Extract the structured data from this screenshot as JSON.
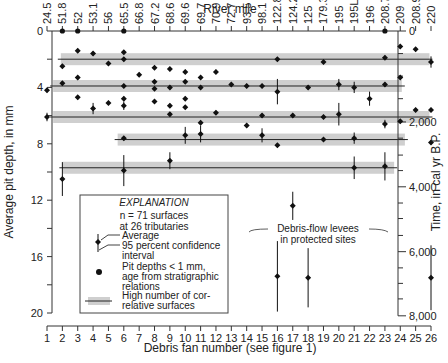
{
  "chart_data": {
    "type": "scatter",
    "title_top_axis": "River mile",
    "xlabel": "Debris fan number (see figure 1)",
    "ylabel": "Average pit depth, in mm",
    "ylabel_right": "Time, in cal yr B.P.",
    "xlim": [
      1,
      26
    ],
    "ylim": [
      0,
      20
    ],
    "x_ticks": [
      "1",
      "2",
      "3",
      "4",
      "5",
      "6",
      "7",
      "8",
      "9",
      "10",
      "11",
      "12",
      "13",
      "14",
      "15",
      "16",
      "17",
      "18",
      "19",
      "20",
      "21",
      "22",
      "23",
      "24",
      "25",
      "26"
    ],
    "y_ticks": [
      "0",
      "4",
      "8",
      "12",
      "16",
      "20"
    ],
    "y_tick_values": [
      0,
      4,
      8,
      12,
      16,
      20
    ],
    "right_ticks": [
      {
        "label": "0",
        "depth": 0
      },
      {
        "label": "2,000",
        "depth": 6.45
      },
      {
        "label": "4,000",
        "depth": 11.05
      },
      {
        "label": "6,000",
        "depth": 15.65
      },
      {
        "label": "8,000",
        "depth": 20.2
      }
    ],
    "right_minor_depths": [
      1.6,
      3.2,
      4.8,
      7.6,
      8.8,
      9.9,
      12.2,
      13.3,
      14.5,
      16.8,
      17.9,
      19.0
    ],
    "river_miles": [
      "24.5",
      "51.8",
      "52",
      "53.1",
      "56",
      "65.5",
      "66.8",
      "67.2",
      "68.6",
      "69.6",
      "69.7",
      "70.9",
      "72.7",
      "93.5",
      "98.1",
      "122.8",
      "124.2",
      "125",
      "179.3",
      "195",
      "195L",
      "196",
      "208.7",
      "209",
      "208.9",
      "220"
    ],
    "grid": false,
    "legend_position": "bottom-left",
    "correlative_bands": [
      {
        "depth": 2.0,
        "from": 1.9,
        "to": 25.9
      },
      {
        "depth": 3.9,
        "from": 1.4,
        "to": 24.1
      },
      {
        "depth": 6.1,
        "from": 1.4,
        "to": 25.9
      },
      {
        "depth": 7.7,
        "from": 5.6,
        "to": 24.3
      },
      {
        "depth": 9.7,
        "from": 2.0,
        "to": 23.6
      }
    ],
    "points": [
      {
        "fan": 2,
        "depth": 0,
        "type": "dot"
      },
      {
        "fan": 3,
        "depth": 0,
        "type": "dot"
      },
      {
        "fan": 6,
        "depth": 0,
        "type": "dot"
      },
      {
        "fan": 23,
        "depth": 0,
        "type": "dot"
      },
      {
        "fan": 3,
        "depth": 1.4,
        "type": "avg"
      },
      {
        "fan": 4,
        "depth": 1.6,
        "type": "avg"
      },
      {
        "fan": 6,
        "depth": 1.5,
        "type": "avg"
      },
      {
        "fan": 2,
        "depth": 2.5,
        "type": "avg"
      },
      {
        "fan": 5,
        "depth": 2.3,
        "type": "avg"
      },
      {
        "fan": 6,
        "depth": 2.0,
        "type": "avg"
      },
      {
        "fan": 8,
        "depth": 2.6,
        "type": "avg"
      },
      {
        "fan": 16,
        "depth": 2.0,
        "type": "avg"
      },
      {
        "fan": 19,
        "depth": 2.2,
        "type": "avg"
      },
      {
        "fan": 23,
        "depth": 1.9,
        "type": "avg"
      },
      {
        "fan": 24,
        "depth": 1.1,
        "type": "avg"
      },
      {
        "fan": 25,
        "depth": 1.3,
        "type": "avg"
      },
      {
        "fan": 26,
        "depth": 2.2,
        "type": "avg",
        "err": 0.4
      },
      {
        "fan": 7,
        "depth": 3.1,
        "type": "avg"
      },
      {
        "fan": 9,
        "depth": 2.7,
        "type": "avg"
      },
      {
        "fan": 10,
        "depth": 2.9,
        "type": "avg"
      },
      {
        "fan": 11,
        "depth": 3.3,
        "type": "avg"
      },
      {
        "fan": 3,
        "depth": 3.3,
        "type": "avg"
      },
      {
        "fan": 2,
        "depth": 3.7,
        "type": "avg"
      },
      {
        "fan": 1,
        "depth": 4.2,
        "type": "avg"
      },
      {
        "fan": 6,
        "depth": 3.9,
        "type": "avg"
      },
      {
        "fan": 8,
        "depth": 3.6,
        "type": "avg"
      },
      {
        "fan": 8,
        "depth": 4.1,
        "type": "avg"
      },
      {
        "fan": 9,
        "depth": 4.0,
        "type": "avg"
      },
      {
        "fan": 10,
        "depth": 3.6,
        "type": "avg"
      },
      {
        "fan": 11,
        "depth": 4.0,
        "type": "avg"
      },
      {
        "fan": 12,
        "depth": 2.9,
        "type": "avg"
      },
      {
        "fan": 13,
        "depth": 3.8,
        "type": "avg"
      },
      {
        "fan": 14,
        "depth": 3.9,
        "type": "avg"
      },
      {
        "fan": 15,
        "depth": 3.9,
        "type": "avg"
      },
      {
        "fan": 16,
        "depth": 4.3,
        "type": "avg",
        "err": 0.9
      },
      {
        "fan": 18,
        "depth": 4.0,
        "type": "avg"
      },
      {
        "fan": 20,
        "depth": 3.8,
        "type": "avg",
        "err": 0.4
      },
      {
        "fan": 21,
        "depth": 4.0,
        "type": "avg",
        "err": 0.4
      },
      {
        "fan": 22,
        "depth": 4.8,
        "type": "avg",
        "err": 0.5
      },
      {
        "fan": 24,
        "depth": 3.3,
        "type": "avg"
      },
      {
        "fan": 23,
        "depth": 3.8,
        "type": "avg"
      },
      {
        "fan": 3,
        "depth": 4.7,
        "type": "avg"
      },
      {
        "fan": 4,
        "depth": 5.5,
        "type": "avg",
        "err": 0.4
      },
      {
        "fan": 5,
        "depth": 5.1,
        "type": "avg"
      },
      {
        "fan": 6,
        "depth": 4.8,
        "type": "avg"
      },
      {
        "fan": 6,
        "depth": 5.3,
        "type": "avg",
        "err": 0.3
      },
      {
        "fan": 8,
        "depth": 5.0,
        "type": "avg"
      },
      {
        "fan": 9,
        "depth": 5.3,
        "type": "avg"
      },
      {
        "fan": 9,
        "depth": 5.9,
        "type": "avg"
      },
      {
        "fan": 10,
        "depth": 4.8,
        "type": "avg"
      },
      {
        "fan": 10,
        "depth": 5.4,
        "type": "avg"
      },
      {
        "fan": 12,
        "depth": 5.8,
        "type": "avg"
      },
      {
        "fan": 1,
        "depth": 6.1,
        "type": "avg",
        "err": 0.3
      },
      {
        "fan": 15,
        "depth": 6.0,
        "type": "avg"
      },
      {
        "fan": 17,
        "depth": 6.0,
        "type": "avg"
      },
      {
        "fan": 19,
        "depth": 6.1,
        "type": "avg"
      },
      {
        "fan": 20,
        "depth": 5.9,
        "type": "avg",
        "err": 0.8
      },
      {
        "fan": 23,
        "depth": 6.6,
        "type": "avg",
        "err": 0.3
      },
      {
        "fan": 24,
        "depth": 6.4,
        "type": "avg"
      },
      {
        "fan": 25,
        "depth": 5.6,
        "type": "avg"
      },
      {
        "fan": 26,
        "depth": 5.6,
        "type": "avg"
      },
      {
        "fan": 11,
        "depth": 6.5,
        "type": "avg"
      },
      {
        "fan": 14,
        "depth": 6.7,
        "type": "avg"
      },
      {
        "fan": 6,
        "depth": 7.6,
        "type": "avg"
      },
      {
        "fan": 10,
        "depth": 7.4,
        "type": "avg",
        "err": 0.6
      },
      {
        "fan": 11,
        "depth": 7.3,
        "type": "avg",
        "err": 0.6
      },
      {
        "fan": 15,
        "depth": 7.4,
        "type": "avg",
        "err": 0.5
      },
      {
        "fan": 16,
        "depth": 8.1,
        "type": "avg"
      },
      {
        "fan": 19,
        "depth": 7.7,
        "type": "avg"
      },
      {
        "fan": 26,
        "depth": 7.9,
        "type": "avg"
      },
      {
        "fan": 21,
        "depth": 7.6,
        "type": "avg",
        "err": 0.4
      },
      {
        "fan": 2,
        "depth": 10.5,
        "type": "avg",
        "err": 1.2
      },
      {
        "fan": 6,
        "depth": 9.9,
        "type": "avg",
        "err": 1.1
      },
      {
        "fan": 9,
        "depth": 9.2,
        "type": "avg",
        "err": 0.6
      },
      {
        "fan": 21,
        "depth": 9.7,
        "type": "avg",
        "err": 0.8
      },
      {
        "fan": 23,
        "depth": 9.6,
        "type": "avg",
        "err": 1.0
      },
      {
        "fan": 17,
        "depth": 12.4,
        "type": "avg",
        "err": 1.0
      },
      {
        "fan": 16,
        "depth": 17.4,
        "type": "avg",
        "err": 2.5
      },
      {
        "fan": 18,
        "depth": 17.5,
        "type": "avg",
        "err": 2.1
      },
      {
        "fan": 26,
        "depth": 17.5,
        "type": "avg",
        "err": 2.3
      }
    ],
    "annotations": [
      {
        "text": "Debris-flow levees",
        "line": 1
      },
      {
        "text": "in protected sites",
        "line": 2
      }
    ],
    "legend": {
      "title": "EXPLANATION",
      "summary_line1": "n = 71 surfaces",
      "summary_line2": "at 26 tributaries",
      "avg_label": "Average",
      "ci_label1": "95 percent confidence",
      "ci_label2": "interval",
      "dot_label1": "Pit depths < 1 mm,",
      "dot_label2": "age from stratigraphic",
      "dot_label3": "relations",
      "band_label1": "High number of cor-",
      "band_label2": "relative surfaces"
    },
    "colors": {
      "band": "#cfcfcf",
      "ink": "#111111",
      "axis": "#333333"
    }
  }
}
